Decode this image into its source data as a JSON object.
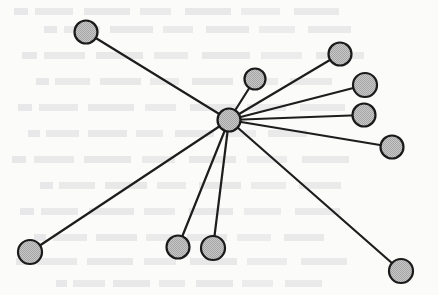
{
  "figure": {
    "canvas": {
      "width": 438,
      "height": 295
    },
    "background_color": "#fbfbfa",
    "node_fill_color": "#b9b9b9",
    "node_stroke_color": "#1a1a1a",
    "edge_color": "#1d1d1d",
    "node_stroke_width": 2.2,
    "edge_width": 2.2
  },
  "chart_data": {
    "type": "diagram",
    "subtype": "node-link-star-graph",
    "node_count": 11,
    "edge_count": 10,
    "hub_id": "hub",
    "nodes": [
      {
        "id": "hub",
        "label": "",
        "x": 229,
        "y": 120,
        "r": 11.5,
        "role": "hub",
        "degree": 10
      },
      {
        "id": "leaf-nw",
        "label": "",
        "x": 86,
        "y": 32,
        "r": 11.5,
        "role": "leaf",
        "degree": 1
      },
      {
        "id": "leaf-n",
        "label": "",
        "x": 255,
        "y": 79,
        "r": 10.5,
        "role": "leaf",
        "degree": 1
      },
      {
        "id": "leaf-ne-1",
        "label": "",
        "x": 340,
        "y": 54,
        "r": 11.5,
        "role": "leaf",
        "degree": 1
      },
      {
        "id": "leaf-ne-2",
        "label": "",
        "x": 365,
        "y": 85,
        "r": 12.0,
        "role": "leaf",
        "degree": 1
      },
      {
        "id": "leaf-e-1",
        "label": "",
        "x": 364,
        "y": 115,
        "r": 11.5,
        "role": "leaf",
        "degree": 1
      },
      {
        "id": "leaf-e-2",
        "label": "",
        "x": 392,
        "y": 147,
        "r": 11.5,
        "role": "leaf",
        "degree": 1
      },
      {
        "id": "leaf-se",
        "label": "",
        "x": 401,
        "y": 271,
        "r": 12.0,
        "role": "leaf",
        "degree": 1
      },
      {
        "id": "leaf-s-2",
        "label": "",
        "x": 213,
        "y": 248,
        "r": 12.0,
        "role": "leaf",
        "degree": 1
      },
      {
        "id": "leaf-s-1",
        "label": "",
        "x": 178,
        "y": 247,
        "r": 11.5,
        "role": "leaf",
        "degree": 1
      },
      {
        "id": "leaf-sw",
        "label": "",
        "x": 30,
        "y": 252,
        "r": 12.0,
        "role": "leaf",
        "degree": 1
      }
    ],
    "edges": [
      {
        "id": "edge-hub-leaf-nw",
        "source": "hub",
        "target": "leaf-nw"
      },
      {
        "id": "edge-hub-leaf-n",
        "source": "hub",
        "target": "leaf-n"
      },
      {
        "id": "edge-hub-leaf-ne-1",
        "source": "hub",
        "target": "leaf-ne-1"
      },
      {
        "id": "edge-hub-leaf-ne-2",
        "source": "hub",
        "target": "leaf-ne-2"
      },
      {
        "id": "edge-hub-leaf-e-1",
        "source": "hub",
        "target": "leaf-e-1"
      },
      {
        "id": "edge-hub-leaf-e-2",
        "source": "hub",
        "target": "leaf-e-2"
      },
      {
        "id": "edge-hub-leaf-se",
        "source": "hub",
        "target": "leaf-se"
      },
      {
        "id": "edge-hub-leaf-s-2",
        "source": "hub",
        "target": "leaf-s-2"
      },
      {
        "id": "edge-hub-leaf-s-1",
        "source": "hub",
        "target": "leaf-s-1"
      },
      {
        "id": "edge-hub-leaf-sw",
        "source": "hub",
        "target": "leaf-sw"
      }
    ],
    "legend": [],
    "annotations": [],
    "axis": {
      "show": false
    },
    "grid": false
  },
  "bleed_through": {
    "description": "Faint ghost text bleeding through from the reverse side of the scanned page",
    "rows": [
      {
        "top": 8,
        "left": 14,
        "width": 350
      },
      {
        "top": 26,
        "left": 44,
        "width": 330
      },
      {
        "top": 52,
        "left": 22,
        "width": 368
      },
      {
        "top": 78,
        "left": 36,
        "width": 318
      },
      {
        "top": 104,
        "left": 18,
        "width": 352
      },
      {
        "top": 130,
        "left": 28,
        "width": 300
      },
      {
        "top": 156,
        "left": 12,
        "width": 362
      },
      {
        "top": 182,
        "left": 40,
        "width": 324
      },
      {
        "top": 208,
        "left": 20,
        "width": 344
      },
      {
        "top": 234,
        "left": 34,
        "width": 312
      },
      {
        "top": 258,
        "left": 16,
        "width": 356
      },
      {
        "top": 280,
        "left": 56,
        "width": 286
      }
    ]
  }
}
